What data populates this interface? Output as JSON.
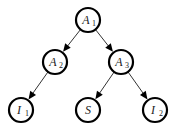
{
  "diagram": {
    "type": "tree",
    "nodes": [
      {
        "id": "A1",
        "label": "A",
        "sub": "1",
        "x": 88,
        "y": 20
      },
      {
        "id": "A2",
        "label": "A",
        "sub": "2",
        "x": 55,
        "y": 62
      },
      {
        "id": "A3",
        "label": "A",
        "sub": "3",
        "x": 121,
        "y": 62
      },
      {
        "id": "I1",
        "label": "I",
        "sub": "1",
        "x": 21,
        "y": 110
      },
      {
        "id": "S",
        "label": "S",
        "sub": "",
        "x": 88,
        "y": 110
      },
      {
        "id": "I2",
        "label": "I",
        "sub": "2",
        "x": 155,
        "y": 110
      }
    ],
    "edges": [
      {
        "from": "A1",
        "to": "A2"
      },
      {
        "from": "A1",
        "to": "A3"
      },
      {
        "from": "A2",
        "to": "I1"
      },
      {
        "from": "A3",
        "to": "S"
      },
      {
        "from": "A3",
        "to": "I2"
      }
    ],
    "node_radius": 12,
    "colors": {
      "stroke": "#000000",
      "fill": "#ffffff",
      "edge": "#333333"
    }
  }
}
